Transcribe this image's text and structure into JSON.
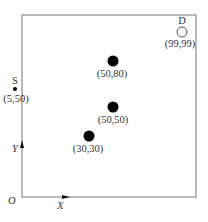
{
  "diagram": {
    "type": "coordinate-grid",
    "origin_label": "O",
    "x_axis_label": "X",
    "y_axis_label": "Y",
    "source": {
      "label": "S",
      "coord_label": "(5,50)",
      "x": 5,
      "y": 50
    },
    "destination": {
      "label": "D",
      "coord_label": "(99,99)",
      "x": 99,
      "y": 99
    },
    "obstacles": [
      {
        "coord_label": "(50,80)",
        "x": 50,
        "y": 80
      },
      {
        "coord_label": "(50,50)",
        "x": 50,
        "y": 50
      },
      {
        "coord_label": "(30,30)",
        "x": 30,
        "y": 30
      }
    ],
    "colors": {
      "frame": "#888888",
      "filled_node": "#000000",
      "hollow_node": "#555555"
    }
  }
}
